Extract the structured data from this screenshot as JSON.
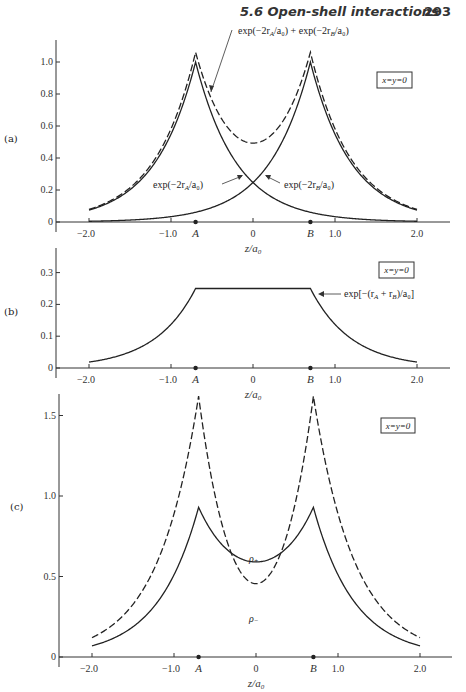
{
  "header": {
    "section": "5.6  Open-shell interactions",
    "page": "293"
  },
  "chart_data": [
    {
      "panel": "(a)",
      "type": "line",
      "xlabel": "z/a0",
      "ylabel": "",
      "xlim": [
        -2.3,
        2.4
      ],
      "ylim": [
        0,
        1.1
      ],
      "x_ticks": [
        -2.0,
        -1.0,
        0,
        1.0,
        2.0
      ],
      "x_tick_labels": [
        "−2.0",
        "−1.0",
        "0",
        "1.0",
        "2.0"
      ],
      "y_ticks": [
        0,
        0.2,
        0.4,
        0.6,
        0.8,
        1.0
      ],
      "y_tick_labels": [
        "0",
        "0.2",
        "0.4",
        "0.6",
        "0.8",
        "1.0"
      ],
      "nuclei": [
        {
          "label": "A",
          "z": -0.7
        },
        {
          "label": "B",
          "z": 0.7
        }
      ],
      "box_label": "x=y=0",
      "series": [
        {
          "name": "exp(−2r_A/a0)",
          "style": "solid",
          "func": "expA",
          "x": [
            -2.0,
            -1.5,
            -1.0,
            -0.7,
            -0.4,
            0,
            0.4,
            0.7,
            1.0,
            1.5,
            2.0
          ],
          "values": [
            0.07,
            0.2,
            0.55,
            1.0,
            0.55,
            0.25,
            0.11,
            0.06,
            0.034,
            0.012,
            0.005
          ]
        },
        {
          "name": "exp(−2r_B/a0)",
          "style": "solid",
          "func": "expB",
          "x": [
            -2.0,
            -1.5,
            -1.0,
            -0.7,
            -0.4,
            0,
            0.4,
            0.7,
            1.0,
            1.5,
            2.0
          ],
          "values": [
            0.005,
            0.012,
            0.034,
            0.06,
            0.11,
            0.25,
            0.55,
            1.0,
            0.55,
            0.2,
            0.07
          ]
        },
        {
          "name": "exp(−2r_A/a0) + exp(−2r_B/a0)",
          "style": "dashed",
          "func": "sum",
          "x": [
            -2.0,
            -1.5,
            -1.0,
            -0.7,
            -0.4,
            0,
            0.4,
            0.7,
            1.0,
            1.5,
            2.0
          ],
          "values": [
            0.075,
            0.21,
            0.58,
            1.06,
            0.66,
            0.49,
            0.66,
            1.06,
            0.58,
            0.21,
            0.075
          ]
        }
      ],
      "annotations": [
        {
          "text": "exp(−2r_A/a0) + exp(−2r_B/a0)",
          "target": "sum"
        },
        {
          "text": "exp(−2r_A/a0)",
          "target": "expA"
        },
        {
          "text": "exp(−2r_B/a0)",
          "target": "expB"
        }
      ]
    },
    {
      "panel": "(b)",
      "type": "line",
      "xlabel": "z/a0",
      "xlim": [
        -2.3,
        2.4
      ],
      "ylim": [
        0,
        0.35
      ],
      "x_ticks": [
        -2.0,
        -1.0,
        0,
        1.0,
        2.0
      ],
      "x_tick_labels": [
        "−2.0",
        "−1.0",
        "0",
        "1.0",
        "2.0"
      ],
      "y_ticks": [
        0,
        0.1,
        0.2,
        0.3
      ],
      "y_tick_labels": [
        "0",
        "0.1",
        "0.2",
        "0.3"
      ],
      "nuclei": [
        {
          "label": "A",
          "z": -0.7
        },
        {
          "label": "B",
          "z": 0.7
        }
      ],
      "box_label": "x=y=0",
      "series": [
        {
          "name": "exp[−(r_A + r_B)/a0]",
          "style": "solid",
          "func": "prod",
          "x": [
            -2.0,
            -1.5,
            -1.0,
            -0.7,
            0,
            0.7,
            1.0,
            1.5,
            2.0
          ],
          "values": [
            0.018,
            0.05,
            0.14,
            0.25,
            0.25,
            0.25,
            0.14,
            0.05,
            0.018
          ]
        }
      ],
      "annotations": [
        {
          "text": "exp[−(r_A + r_B)/a0]",
          "target": "prod"
        }
      ]
    },
    {
      "panel": "(c)",
      "type": "line",
      "xlabel": "z/a0",
      "xlim": [
        -2.3,
        2.4
      ],
      "ylim": [
        0,
        1.7
      ],
      "x_ticks": [
        -2.0,
        -1.0,
        0,
        1.0,
        2.0
      ],
      "x_tick_labels": [
        "−2.0",
        "−1.0",
        "0",
        "1.0",
        "2.0"
      ],
      "y_ticks": [
        0,
        0.5,
        1.0,
        1.5
      ],
      "y_tick_labels": [
        "0",
        "0.5",
        "1.0",
        "1.5"
      ],
      "nuclei": [
        {
          "label": "A",
          "z": -0.7
        },
        {
          "label": "B",
          "z": 0.7
        }
      ],
      "box_label": "x=y=0",
      "series": [
        {
          "name": "ρ+",
          "style": "solid",
          "func": "rhoplus",
          "x": [
            -2.0,
            -1.5,
            -1.0,
            -0.7,
            -0.4,
            0,
            0.4,
            0.7,
            1.0,
            1.5,
            2.0
          ],
          "values": [
            0.09,
            0.24,
            0.55,
            0.93,
            0.7,
            0.57,
            0.7,
            0.93,
            0.55,
            0.24,
            0.09
          ]
        },
        {
          "name": "ρ−",
          "style": "dashed",
          "func": "rhominus",
          "x": [
            -2.0,
            -1.5,
            -1.0,
            -0.7,
            -0.4,
            0,
            0.4,
            0.7,
            1.0,
            1.5,
            2.0
          ],
          "values": [
            0.12,
            0.33,
            0.85,
            1.62,
            0.78,
            0.29,
            0.78,
            1.62,
            0.85,
            0.33,
            0.12
          ]
        }
      ],
      "annotations": [
        {
          "text": "ρ+",
          "target": "rhoplus"
        },
        {
          "text": "ρ−",
          "target": "rhominus"
        }
      ]
    }
  ],
  "panels": {
    "a": {
      "label": "(a)",
      "box": "x=y=0",
      "ann_sum": "exp(−2r",
      "ann_sum_tail": "/a₀) + exp(−2r",
      "ann_sum_end": "/a₀)",
      "ann_A": "exp(−2r",
      "ann_A_end": "/a₀)",
      "ann_B": "exp(−2r",
      "ann_B_end": "/a₀)",
      "sub_A": "A",
      "sub_B": "B"
    },
    "b": {
      "label": "(b)",
      "box": "x=y=0",
      "ann": "exp[−(r",
      "ann_mid": " + r",
      "ann_end": ")/a₀]",
      "sub_A": "A",
      "sub_B": "B"
    },
    "c": {
      "label": "(c)",
      "box": "x=y=0",
      "rho_plus": "ρ",
      "rho_plus_sub": "+",
      "rho_minus": "ρ",
      "rho_minus_sub": "−"
    },
    "xlabel": "z/a",
    "xlabel_sub": "0",
    "nucleus_A": "A",
    "nucleus_B": "B"
  }
}
